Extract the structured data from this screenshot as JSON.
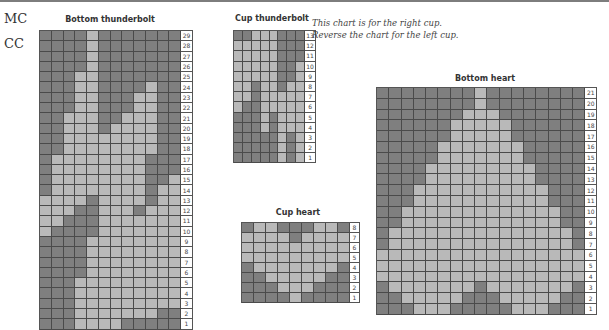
{
  "legend": {
    "mc_label": "MC",
    "cc_label": "CC"
  },
  "colors": {
    "MC": "#7f7f7f",
    "CC": "#b9b9b9",
    "grid": "#4a4a4a"
  },
  "note": {
    "line1": "This chart is for the right cup.",
    "line2": "Reverse the chart for the left cup."
  },
  "charts": {
    "bottom_thunderbolt": {
      "title": "Bottom thunderbolt",
      "cols": 12,
      "rows": [
        {
          "n": "29",
          "light": [
            5
          ]
        },
        {
          "n": "28",
          "light": [
            5
          ]
        },
        {
          "n": "27",
          "light": [
            5
          ]
        },
        {
          "n": "26",
          "light": [
            5
          ]
        },
        {
          "n": "25",
          "light": [
            4,
            5
          ]
        },
        {
          "n": "24",
          "light": [
            4,
            5,
            10
          ]
        },
        {
          "n": "23",
          "light": [
            4,
            5,
            9,
            10
          ]
        },
        {
          "n": "22",
          "light": [
            4,
            5,
            9,
            10
          ]
        },
        {
          "n": "21",
          "light": [
            3,
            4,
            5,
            8,
            9,
            10
          ]
        },
        {
          "n": "20",
          "light": [
            3,
            4,
            5,
            7,
            8,
            9,
            10
          ]
        },
        {
          "n": "19",
          "light": [
            3,
            4,
            5,
            6,
            7,
            8,
            9,
            10
          ]
        },
        {
          "n": "18",
          "light": [
            3,
            4,
            5,
            6,
            7,
            8,
            9,
            10
          ]
        },
        {
          "n": "17",
          "light": [
            2,
            3,
            4,
            5,
            6,
            7,
            8,
            9
          ]
        },
        {
          "n": "16",
          "light": [
            2,
            3,
            4,
            5,
            6,
            7,
            8,
            9
          ]
        },
        {
          "n": "15",
          "light": [
            2,
            3,
            4,
            5,
            6,
            7,
            8,
            9,
            12
          ]
        },
        {
          "n": "14",
          "light": [
            2,
            3,
            4,
            5,
            6,
            7,
            8,
            9,
            11,
            12
          ]
        },
        {
          "n": "13",
          "light": [
            1,
            2,
            3,
            4,
            6,
            7,
            8,
            9,
            11,
            12
          ]
        },
        {
          "n": "12",
          "light": [
            1,
            2,
            3,
            6,
            7,
            8,
            10,
            11,
            12
          ]
        },
        {
          "n": "11",
          "light": [
            1,
            2,
            6,
            7,
            8,
            9,
            10,
            11,
            12
          ]
        },
        {
          "n": "10",
          "light": [
            1,
            6,
            7,
            8,
            9,
            10,
            11,
            12
          ]
        },
        {
          "n": "9",
          "light": [
            5,
            6,
            7,
            8,
            9,
            10,
            11,
            12
          ]
        },
        {
          "n": "8",
          "light": [
            5,
            6,
            7,
            8,
            9,
            10,
            11,
            12
          ]
        },
        {
          "n": "7",
          "light": [
            5,
            6,
            7,
            8,
            9,
            10,
            11,
            12
          ]
        },
        {
          "n": "6",
          "light": [
            5,
            6,
            7,
            8,
            9,
            10,
            11,
            12
          ]
        },
        {
          "n": "5",
          "light": [
            4,
            5,
            6,
            7,
            8,
            9,
            10,
            11,
            12
          ]
        },
        {
          "n": "4",
          "light": [
            4,
            5,
            6,
            7,
            8,
            9,
            10,
            11,
            12
          ]
        },
        {
          "n": "3",
          "light": [
            4,
            5,
            6,
            7,
            8,
            9,
            10,
            11,
            12
          ]
        },
        {
          "n": "2",
          "light": [
            4,
            5,
            6,
            7,
            8,
            9,
            10
          ]
        },
        {
          "n": "1",
          "light": [
            4,
            5,
            6,
            7
          ]
        }
      ]
    },
    "cup_thunderbolt": {
      "title": "Cup thunderbolt",
      "cols": 8,
      "rows": [
        {
          "n": "13",
          "light": [
            3,
            4,
            5
          ]
        },
        {
          "n": "12",
          "light": [
            1,
            2,
            3,
            4,
            5
          ]
        },
        {
          "n": "11",
          "light": [
            1,
            2,
            3,
            4,
            5
          ]
        },
        {
          "n": "10",
          "light": [
            1,
            2,
            3,
            4,
            5,
            8
          ]
        },
        {
          "n": "9",
          "light": [
            1,
            2,
            3,
            4,
            5,
            8
          ]
        },
        {
          "n": "8",
          "light": [
            1,
            2,
            4,
            5,
            7,
            8
          ]
        },
        {
          "n": "7",
          "light": [
            1,
            2,
            4,
            5,
            6,
            7,
            8
          ]
        },
        {
          "n": "6",
          "light": [
            1,
            4,
            5,
            6,
            7,
            8
          ]
        },
        {
          "n": "5",
          "light": [
            4,
            6,
            7,
            8
          ]
        },
        {
          "n": "4",
          "light": [
            4,
            6,
            7,
            8
          ]
        },
        {
          "n": "3",
          "light": [
            6,
            8
          ]
        },
        {
          "n": "2",
          "light": [
            6,
            8
          ]
        },
        {
          "n": "1",
          "light": [
            6,
            8
          ]
        }
      ]
    },
    "cup_heart": {
      "title": "Cup heart",
      "cols": 9,
      "rows": [
        {
          "n": "8",
          "light": [
            2,
            3,
            7,
            8
          ]
        },
        {
          "n": "7",
          "light": [
            1,
            2,
            3,
            4,
            6,
            7,
            8,
            9
          ]
        },
        {
          "n": "6",
          "light": [
            1,
            2,
            3,
            4,
            5,
            6,
            7,
            8,
            9
          ]
        },
        {
          "n": "5",
          "light": [
            1,
            2,
            3,
            4,
            5,
            6,
            7,
            8,
            9
          ]
        },
        {
          "n": "4",
          "light": [
            2,
            3,
            4,
            5,
            6,
            7,
            8
          ]
        },
        {
          "n": "3",
          "light": [
            3,
            4,
            5,
            6,
            7
          ]
        },
        {
          "n": "2",
          "light": [
            4,
            5,
            6
          ]
        },
        {
          "n": "1",
          "light": [
            5
          ]
        }
      ]
    },
    "bottom_heart": {
      "title": "Bottom heart",
      "cols": 17,
      "rows": [
        {
          "n": "21",
          "light": [
            9
          ]
        },
        {
          "n": "20",
          "light": [
            9
          ]
        },
        {
          "n": "19",
          "light": [
            8,
            9,
            10
          ]
        },
        {
          "n": "18",
          "light": [
            7,
            8,
            9,
            10,
            11
          ]
        },
        {
          "n": "17",
          "light": [
            7,
            8,
            9,
            10,
            11
          ]
        },
        {
          "n": "16",
          "light": [
            6,
            7,
            8,
            9,
            10,
            11,
            12
          ]
        },
        {
          "n": "15",
          "light": [
            6,
            7,
            8,
            9,
            10,
            11,
            12
          ]
        },
        {
          "n": "14",
          "light": [
            5,
            6,
            7,
            8,
            9,
            10,
            11,
            12,
            13
          ]
        },
        {
          "n": "13",
          "light": [
            5,
            6,
            7,
            8,
            9,
            10,
            11,
            12,
            13
          ]
        },
        {
          "n": "12",
          "light": [
            4,
            5,
            6,
            7,
            8,
            9,
            10,
            11,
            12,
            13,
            14
          ]
        },
        {
          "n": "11",
          "light": [
            4,
            5,
            6,
            7,
            8,
            9,
            10,
            11,
            12,
            13,
            14
          ]
        },
        {
          "n": "10",
          "light": [
            3,
            4,
            5,
            6,
            7,
            8,
            9,
            10,
            11,
            12,
            13,
            14,
            15
          ]
        },
        {
          "n": "9",
          "light": [
            3,
            4,
            5,
            6,
            7,
            8,
            9,
            10,
            11,
            12,
            13,
            14,
            15
          ]
        },
        {
          "n": "8",
          "light": [
            2,
            3,
            4,
            5,
            6,
            7,
            8,
            9,
            10,
            11,
            12,
            13,
            14,
            15,
            16
          ]
        },
        {
          "n": "7",
          "light": [
            2,
            3,
            4,
            5,
            6,
            7,
            8,
            9,
            10,
            11,
            12,
            13,
            14,
            15,
            16
          ]
        },
        {
          "n": "6",
          "light": [
            1,
            2,
            3,
            4,
            5,
            6,
            7,
            8,
            9,
            10,
            11,
            12,
            13,
            14,
            15,
            16,
            17
          ]
        },
        {
          "n": "5",
          "light": [
            1,
            2,
            3,
            4,
            5,
            6,
            7,
            8,
            9,
            10,
            11,
            12,
            13,
            14,
            15,
            16,
            17
          ]
        },
        {
          "n": "4",
          "light": [
            1,
            2,
            3,
            4,
            5,
            6,
            7,
            8,
            9,
            10,
            11,
            12,
            13,
            14,
            15,
            16,
            17
          ]
        },
        {
          "n": "3",
          "light": [
            2,
            3,
            4,
            5,
            6,
            7,
            8,
            10,
            11,
            12,
            13,
            14,
            15,
            16
          ]
        },
        {
          "n": "2",
          "light": [
            3,
            4,
            5,
            6,
            7,
            11,
            12,
            13,
            14,
            15
          ]
        },
        {
          "n": "1",
          "light": [
            4,
            5,
            6,
            12,
            13,
            14
          ]
        }
      ]
    }
  }
}
